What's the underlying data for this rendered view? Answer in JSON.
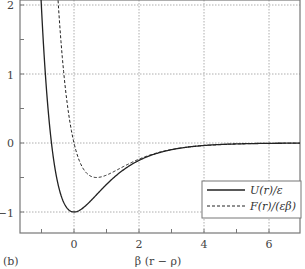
{
  "chart_data": {
    "type": "line",
    "title": "",
    "panel_label": "(b)",
    "xlabel": "β (r − ρ)",
    "ylabel": "",
    "xlim": [
      -1.66,
      6.95
    ],
    "ylim": [
      -1.3,
      2.07
    ],
    "grid": true,
    "legend_position": "lower right",
    "x_ticks": [
      0,
      2,
      4,
      6
    ],
    "x_minor_ticks": [
      -1,
      1,
      3,
      5
    ],
    "y_ticks": [
      -1,
      0,
      1,
      2
    ],
    "y_minor_ticks": [
      -0.5,
      0.5,
      1.5
    ],
    "series": [
      {
        "name": "U(r)/ε",
        "style": "solid",
        "formula": "exp(-2x) - 2exp(-x)",
        "x": [
          -0.8,
          -0.6,
          -0.4,
          -0.2,
          0,
          0.5,
          1,
          1.5,
          2,
          3,
          4,
          5,
          6,
          7
        ],
        "values": [
          2.0,
          1.67,
          0.25,
          -0.95,
          -1.0,
          -0.84,
          -0.6,
          -0.4,
          -0.25,
          -0.097,
          -0.036,
          -0.013,
          -0.005,
          -0.002
        ]
      },
      {
        "name": "F(r)/(εβ)",
        "style": "dashed",
        "formula": "2exp(-2x) - 2exp(-x)",
        "x": [
          -0.4,
          -0.2,
          0,
          0.69,
          1,
          1.5,
          2,
          3,
          4,
          5,
          6,
          7
        ],
        "values": [
          1.47,
          0.54,
          0.0,
          -0.5,
          -0.47,
          -0.35,
          -0.23,
          -0.095,
          -0.036,
          -0.013,
          -0.005,
          -0.002
        ]
      }
    ]
  },
  "colors": {
    "axis": "#777777",
    "grid": "#999999",
    "curve": "#222222",
    "text": "#444444"
  },
  "legend": {
    "items": [
      {
        "label": "U(r)/ε",
        "style": "solid"
      },
      {
        "label": "F(r)/(εβ)",
        "style": "dashed"
      }
    ]
  },
  "labels": {
    "panel": "(b)",
    "xaxis": "β (r − ρ)",
    "xtick_0": "0",
    "xtick_2": "2",
    "xtick_4": "4",
    "xtick_6": "6",
    "ytick_2": "2",
    "ytick_1": "1",
    "ytick_0": "0",
    "ytick_m1": "−1"
  }
}
